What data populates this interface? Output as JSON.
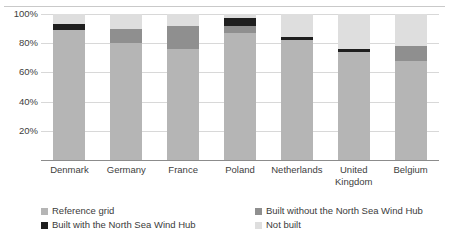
{
  "chart_data": {
    "type": "bar",
    "subtype": "stacked-percentage",
    "title": "",
    "xlabel": "",
    "ylabel": "",
    "ylim": [
      0,
      100
    ],
    "yticks": [
      "20%",
      "40%",
      "60%",
      "80%",
      "100%"
    ],
    "ytick_values": [
      20,
      40,
      60,
      80,
      100
    ],
    "grid": true,
    "legend_position": "bottom",
    "categories": [
      "Denmark",
      "Germany",
      "France",
      "Poland",
      "Netherlands",
      "United\nKingdom",
      "Belgium"
    ],
    "series": [
      {
        "name": "Reference grid",
        "color": "#b5b5b5",
        "values": [
          89,
          80,
          76,
          87,
          82,
          74,
          68
        ]
      },
      {
        "name": "Built without the North Sea Wind Hub",
        "color": "#8f8f8f",
        "values": [
          0,
          10,
          16,
          5,
          0,
          0,
          10
        ]
      },
      {
        "name": "Built with the North Sea Wind Hub",
        "color": "#1f1f1f",
        "values": [
          4,
          0,
          0,
          5,
          2,
          2,
          0
        ]
      },
      {
        "name": "Not built",
        "color": "#dedede",
        "values": [
          7,
          10,
          8,
          3,
          16,
          24,
          22
        ]
      }
    ]
  },
  "legend": {
    "items": [
      {
        "label": "Reference grid",
        "color": "#b5b5b5"
      },
      {
        "label": "Built without the North Sea Wind Hub",
        "color": "#8f8f8f"
      },
      {
        "label": "Built with the North Sea Wind Hub",
        "color": "#1f1f1f"
      },
      {
        "label": "Not built",
        "color": "#dedede"
      }
    ]
  },
  "colors": {
    "gridline": "#d8d8d8",
    "axis": "#8c8c8c",
    "top_rule": "#c9c9c9",
    "text": "#3b3b3b",
    "background": "#ffffff"
  }
}
